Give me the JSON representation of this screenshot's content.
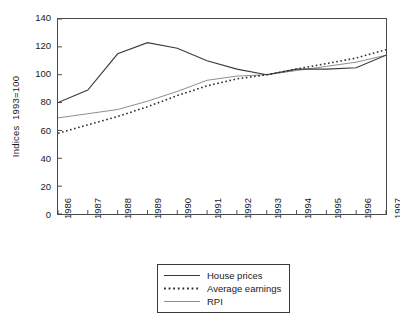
{
  "chart_data": {
    "type": "line",
    "title": "",
    "xlabel": "",
    "ylabel": "Indices  1993=100",
    "categories": [
      "1986",
      "1987",
      "1988",
      "1989",
      "1990",
      "1991",
      "1992",
      "1993",
      "1994",
      "1995",
      "1996",
      "1997"
    ],
    "x": [
      1986,
      1987,
      1988,
      1989,
      1990,
      1991,
      1992,
      1993,
      1994,
      1995,
      1996,
      1997
    ],
    "ylim": [
      0,
      140
    ],
    "yticks": [
      0,
      20,
      40,
      60,
      80,
      100,
      120,
      140
    ],
    "xlim": [
      1986,
      1997
    ],
    "grid": false,
    "legend_position": "below-center",
    "series": [
      {
        "name": "House prices",
        "style": "solid",
        "color": "#3a3a3a",
        "values": [
          80,
          89,
          115,
          123,
          119,
          110,
          104,
          100,
          104,
          104,
          105,
          114
        ]
      },
      {
        "name": "Average earnings",
        "style": "dotted",
        "color": "#2b2b2b",
        "values": [
          58,
          64,
          70,
          77,
          85,
          92,
          97,
          100,
          104,
          108,
          112,
          118
        ]
      },
      {
        "name": "RPI",
        "style": "solid-thin",
        "color": "#8d8d8d",
        "values": [
          69,
          72,
          75,
          81,
          88,
          96,
          99,
          100,
          103,
          106,
          109,
          114
        ]
      }
    ]
  },
  "legend": {
    "items": [
      {
        "label": "House prices"
      },
      {
        "label": "Average earnings"
      },
      {
        "label": "RPI"
      }
    ]
  },
  "axis": {
    "y_title": "Indices  1993=100",
    "y_tick_labels": [
      "140",
      "120",
      "100",
      "80",
      "60",
      "40",
      "20",
      "0"
    ],
    "x_tick_labels": [
      "1986",
      "1987",
      "1988",
      "1989",
      "1990",
      "1991",
      "1992",
      "1993",
      "1994",
      "1995",
      "1996",
      "1997"
    ]
  },
  "colors": {
    "background": "#ffffff",
    "axis": "#4a4a4a",
    "house_prices": "#3a3a3a",
    "average_earnings": "#2b2b2b",
    "rpi": "#8d8d8d",
    "text": "#1a1a1a"
  }
}
